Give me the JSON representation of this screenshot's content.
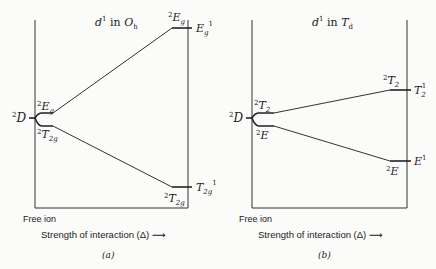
{
  "panels": [
    {
      "id": "a",
      "title_base": "d",
      "title_sup": "1",
      "title_mid": " in ",
      "title_group": "O",
      "title_group_sub": "h",
      "free_ion_term": {
        "sup": "2",
        "base": "D"
      },
      "left_upper_term": {
        "sup": "2",
        "base": "E",
        "sub": "g"
      },
      "left_lower_term": {
        "sup": "2",
        "base": "T",
        "sub": "2g"
      },
      "right_upper_term": {
        "sup": "2",
        "base": "E",
        "sub": "g"
      },
      "right_lower_term": {
        "sup": "2",
        "base": "T",
        "sub": "2g"
      },
      "limit_upper_term": {
        "base": "E",
        "sub": "g",
        "sup": "1"
      },
      "limit_lower_term": {
        "base": "T",
        "sub": "2g",
        "sup": "1"
      },
      "free_ion_label": "Free ion",
      "x_axis_label": "Strength of interaction (Δ) ⟶",
      "caption": "(a)"
    },
    {
      "id": "b",
      "title_base": "d",
      "title_sup": "1",
      "title_mid": " in ",
      "title_group": "T",
      "title_group_sub": "d",
      "free_ion_term": {
        "sup": "2",
        "base": "D"
      },
      "left_upper_term": {
        "sup": "2",
        "base": "T",
        "sub": "2"
      },
      "left_lower_term": {
        "sup": "2",
        "base": "E",
        "sub": ""
      },
      "right_upper_term": {
        "sup": "2",
        "base": "T",
        "sub": "2"
      },
      "right_lower_term": {
        "sup": "2",
        "base": "E",
        "sub": ""
      },
      "limit_upper_term": {
        "base": "T",
        "sub": "2",
        "sup": "1"
      },
      "limit_lower_term": {
        "base": "E",
        "sub": "",
        "sup": "1"
      },
      "free_ion_label": "Free ion",
      "x_axis_label": "Strength of interaction (Δ) ⟶",
      "caption": "(b)"
    }
  ]
}
